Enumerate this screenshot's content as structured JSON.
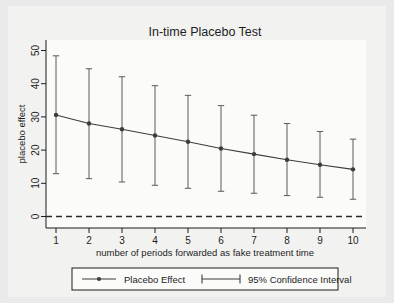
{
  "chart_data": {
    "type": "line",
    "title": "In-time Placebo Test",
    "xlabel": "number of periods forwarded as fake treatment time",
    "ylabel": "placebo effect",
    "x": [
      1,
      2,
      3,
      4,
      5,
      6,
      7,
      8,
      9,
      10
    ],
    "xtick_labels": [
      "1",
      "2",
      "3",
      "4",
      "5",
      "6",
      "7",
      "8",
      "9",
      "10"
    ],
    "ytick_labels": [
      "0",
      "10",
      "20",
      "30",
      "40",
      "50"
    ],
    "ytick_values": [
      0,
      10,
      20,
      30,
      40,
      50
    ],
    "xlim": [
      0.55,
      10.45
    ],
    "ylim": [
      -3,
      53
    ],
    "grid": false,
    "legend_position": "below-axis",
    "reference_line": {
      "y": 0,
      "style": "dashed",
      "label": ""
    },
    "series": [
      {
        "name": "Placebo Effect",
        "marker": "circle",
        "values": [
          30.6,
          28.0,
          26.3,
          24.4,
          22.5,
          20.5,
          18.8,
          17.1,
          15.6,
          14.2
        ]
      }
    ],
    "error_bars": {
      "name": "95% Confidence Interval",
      "lower": [
        12.9,
        11.4,
        10.4,
        9.4,
        8.5,
        7.6,
        7.0,
        6.3,
        5.8,
        5.2
      ],
      "upper": [
        48.4,
        44.5,
        42.1,
        39.4,
        36.5,
        33.4,
        30.5,
        28.0,
        25.6,
        23.3
      ]
    },
    "colors": {
      "line": "#3c3c3c",
      "marker": "#3c3c3c",
      "error_bar": "#5a5a5a",
      "reference_line": "#2a2a2a",
      "frame": "#1d1d1d",
      "background": "#f2f2f1",
      "figure_background": "#eaeaea"
    }
  },
  "legend": {
    "entries": [
      {
        "label": "Placebo Effect",
        "marker": "line-with-dot"
      },
      {
        "label": "95% Confidence Interval",
        "marker": "capped-line"
      }
    ]
  }
}
